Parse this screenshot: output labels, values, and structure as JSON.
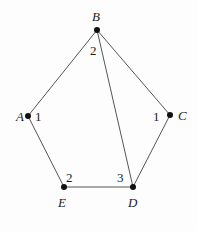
{
  "diagram": {
    "type": "graph",
    "nodes": [
      {
        "id": "A",
        "label": "A",
        "x": 28,
        "y": 116,
        "label_x": 16,
        "label_y": 121
      },
      {
        "id": "B",
        "label": "B",
        "x": 97,
        "y": 30,
        "label_x": 92,
        "label_y": 21
      },
      {
        "id": "C",
        "label": "C",
        "x": 170,
        "y": 115,
        "label_x": 178,
        "label_y": 120
      },
      {
        "id": "D",
        "label": "D",
        "x": 133,
        "y": 187,
        "label_x": 128,
        "label_y": 207
      },
      {
        "id": "E",
        "label": "E",
        "x": 64,
        "y": 187,
        "label_x": 58,
        "label_y": 207
      }
    ],
    "edges": [
      {
        "from": "A",
        "to": "B"
      },
      {
        "from": "B",
        "to": "C"
      },
      {
        "from": "B",
        "to": "D"
      },
      {
        "from": "C",
        "to": "D"
      },
      {
        "from": "D",
        "to": "E"
      },
      {
        "from": "E",
        "to": "A"
      }
    ],
    "angle_labels": [
      {
        "near": "B",
        "text": "2",
        "x": 90,
        "y": 55
      },
      {
        "near": "A",
        "text": "1",
        "x": 35,
        "y": 121
      },
      {
        "near": "C",
        "text": "1",
        "x": 153,
        "y": 121
      },
      {
        "near": "E",
        "text": "2",
        "x": 66,
        "y": 182
      },
      {
        "near": "D",
        "text": "3",
        "x": 117,
        "y": 182
      }
    ],
    "colors": {
      "edge": "#555555",
      "node": "#111111",
      "text": "#222222"
    }
  }
}
